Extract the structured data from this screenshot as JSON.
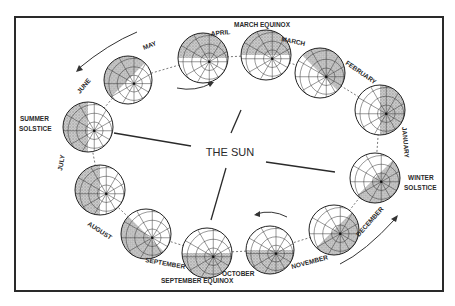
{
  "diagram": {
    "title": "THE SUN",
    "colors": {
      "background": "#ffffff",
      "ink": "#2a2a2a",
      "shade": "#9a9a9a",
      "globe_fill": "#ffffff"
    },
    "frame": {
      "x": 15,
      "y": 17,
      "width": 428,
      "height": 274
    },
    "sun_label": {
      "text": "THE SUN",
      "x": 230,
      "y": 156
    },
    "globes": [
      {
        "id": "may",
        "cx": 128,
        "cy": 80,
        "r": 24,
        "shade": "upper-left"
      },
      {
        "id": "april",
        "cx": 203,
        "cy": 58,
        "r": 25,
        "shade": "upper"
      },
      {
        "id": "march-equinox",
        "cx": 266,
        "cy": 55,
        "r": 25,
        "shade": "upper"
      },
      {
        "id": "february",
        "cx": 320,
        "cy": 73,
        "r": 25,
        "shade": "upper-right"
      },
      {
        "id": "january",
        "cx": 380,
        "cy": 110,
        "r": 25,
        "shade": "right"
      },
      {
        "id": "winter-solstice",
        "cx": 375,
        "cy": 178,
        "r": 25,
        "shade": "lower-right"
      },
      {
        "id": "december",
        "cx": 334,
        "cy": 230,
        "r": 25,
        "shade": "lower-right"
      },
      {
        "id": "november",
        "cx": 270,
        "cy": 250,
        "r": 24,
        "shade": "lower"
      },
      {
        "id": "october",
        "cx": 207,
        "cy": 253,
        "r": 25,
        "shade": "lower"
      },
      {
        "id": "september",
        "cx": 146,
        "cy": 234,
        "r": 25,
        "shade": "lower-left"
      },
      {
        "id": "july",
        "cx": 100,
        "cy": 190,
        "r": 25,
        "shade": "left"
      },
      {
        "id": "summer-solstice",
        "cx": 88,
        "cy": 127,
        "r": 25,
        "shade": "left"
      }
    ],
    "labels": {
      "march_equinox": "MARCH EQUINOX",
      "march": "MARCH",
      "april": "APRIL",
      "may": "MAY",
      "june": "JUNE",
      "summer_solstice_1": "SUMMER",
      "summer_solstice_2": "SOLSTICE",
      "july": "JULY",
      "august": "AUGUST",
      "september": "SEPTEMBER",
      "september_equinox": "SEPTEMBER EQUINOX",
      "october": "OCTOBER",
      "november": "NOVEMBER",
      "december": "DECEMBER",
      "winter_solstice_1": "WINTER",
      "winter_solstice_2": "SOLSTICE",
      "january": "JANUARY",
      "february": "FEBRUARY"
    }
  }
}
